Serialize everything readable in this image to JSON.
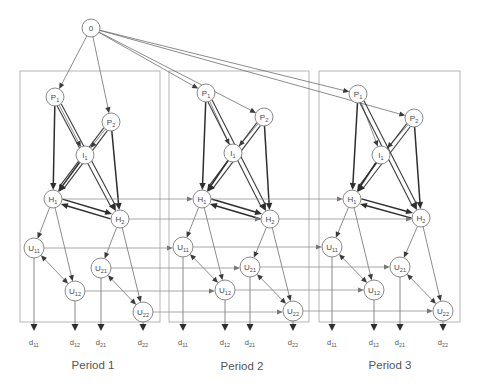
{
  "diagram": {
    "root": {
      "label": "0"
    },
    "node_labels": {
      "P1": {
        "base": "P",
        "sub": "1"
      },
      "P2": {
        "base": "P",
        "sub": "2"
      },
      "I1": {
        "base": "I",
        "sub": "1"
      },
      "H1": {
        "base": "H",
        "sub": "1"
      },
      "H2": {
        "base": "H",
        "sub": "2"
      },
      "U11": {
        "base": "U",
        "sub": "11"
      },
      "U12": {
        "base": "U",
        "sub": "12"
      },
      "U21": {
        "base": "U",
        "sub": "21"
      },
      "U22": {
        "base": "U",
        "sub": "22"
      }
    },
    "output_labels": {
      "d11": {
        "base": "d",
        "sub": "11"
      },
      "d12": {
        "base": "d",
        "sub": "12"
      },
      "d21": {
        "base": "d",
        "sub": "21"
      },
      "d22": {
        "base": "d",
        "sub": "22"
      }
    },
    "periods": [
      {
        "label": "Period 1"
      },
      {
        "label": "Period 2"
      },
      {
        "label": "Period 3"
      }
    ],
    "period_nodes": [
      "P1",
      "P2",
      "I1",
      "H1",
      "H2",
      "U11",
      "U12",
      "U21",
      "U22"
    ],
    "root_edges_to": [
      "P1",
      "P2"
    ],
    "edges": [
      {
        "from": "P1",
        "to": "H1",
        "style": "strong"
      },
      {
        "from": "P1",
        "to": "I1",
        "style": "single"
      },
      {
        "from": "P1",
        "to": "H2",
        "style": "band"
      },
      {
        "from": "P2",
        "to": "I1",
        "style": "single"
      },
      {
        "from": "P2",
        "to": "H1",
        "style": "band"
      },
      {
        "from": "P2",
        "to": "H2",
        "style": "strong"
      },
      {
        "from": "I1",
        "to": "H1",
        "style": "strong"
      },
      {
        "from": "H1",
        "to": "H2",
        "style": "strong-pair"
      },
      {
        "from": "H1",
        "to": "U11",
        "style": "single"
      },
      {
        "from": "H1",
        "to": "U12",
        "style": "single"
      },
      {
        "from": "H2",
        "to": "U21",
        "style": "single"
      },
      {
        "from": "H2",
        "to": "U22",
        "style": "single"
      },
      {
        "from": "U11",
        "to": "U12",
        "style": "bidirectional"
      },
      {
        "from": "U21",
        "to": "U22",
        "style": "bidirectional"
      }
    ],
    "outputs": [
      {
        "from": "U11",
        "to": "d11"
      },
      {
        "from": "U12",
        "to": "d12"
      },
      {
        "from": "U21",
        "to": "d21"
      },
      {
        "from": "U22",
        "to": "d22"
      }
    ],
    "carry_over": [
      "H1",
      "H2",
      "U11",
      "U12",
      "U21",
      "U22"
    ]
  }
}
